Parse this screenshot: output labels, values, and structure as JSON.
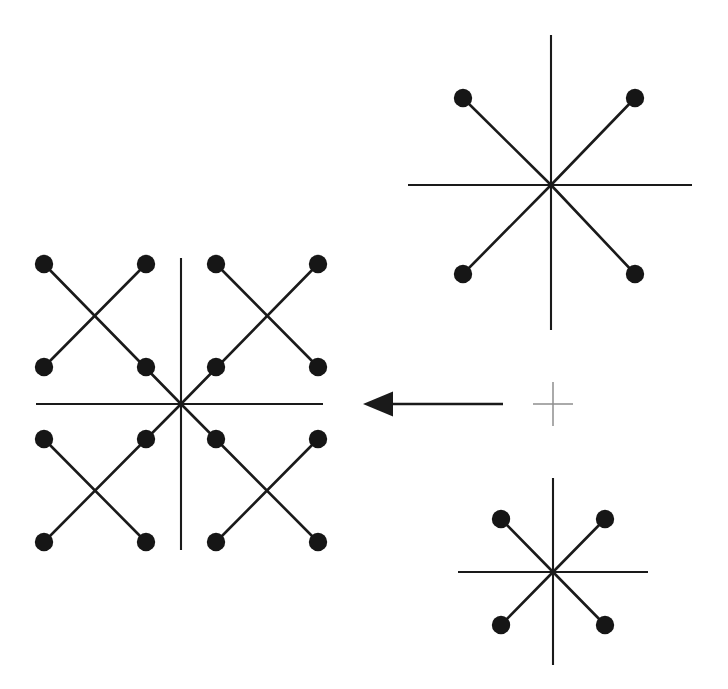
{
  "figure": {
    "background_color": "#ffffff",
    "ink_color": "#1a1a1a",
    "dot_color": "#161616",
    "marker_color": "#8e8e8e",
    "canvas": {
      "width": 728,
      "height": 689
    }
  },
  "stars": [
    {
      "id": "result-star",
      "name": "composite-star-left",
      "role": "result",
      "center": {
        "x": 181,
        "y": 404
      },
      "axis_horizontal": {
        "x1": 36,
        "x2": 323
      },
      "axis_vertical": {
        "y1": 258,
        "y2": 550
      },
      "dot_radius": 9.2,
      "dot_count": 16,
      "quadrant_count": 4,
      "dots": [
        {
          "x": 44,
          "y": 264,
          "ring": "outer",
          "quadrant": "upper-left"
        },
        {
          "x": 146,
          "y": 264,
          "ring": "outer",
          "quadrant": "upper-left"
        },
        {
          "x": 44,
          "y": 367,
          "ring": "outer",
          "quadrant": "upper-left"
        },
        {
          "x": 146,
          "y": 367,
          "ring": "inner",
          "quadrant": "upper-left"
        },
        {
          "x": 216,
          "y": 264,
          "ring": "outer",
          "quadrant": "upper-right"
        },
        {
          "x": 318,
          "y": 264,
          "ring": "outer",
          "quadrant": "upper-right"
        },
        {
          "x": 216,
          "y": 367,
          "ring": "inner",
          "quadrant": "upper-right"
        },
        {
          "x": 318,
          "y": 367,
          "ring": "outer",
          "quadrant": "upper-right"
        },
        {
          "x": 44,
          "y": 439,
          "ring": "outer",
          "quadrant": "lower-left"
        },
        {
          "x": 146,
          "y": 439,
          "ring": "inner",
          "quadrant": "lower-left"
        },
        {
          "x": 44,
          "y": 542,
          "ring": "outer",
          "quadrant": "lower-left"
        },
        {
          "x": 146,
          "y": 542,
          "ring": "outer",
          "quadrant": "lower-left"
        },
        {
          "x": 216,
          "y": 439,
          "ring": "inner",
          "quadrant": "lower-right"
        },
        {
          "x": 318,
          "y": 439,
          "ring": "outer",
          "quadrant": "lower-right"
        },
        {
          "x": 216,
          "y": 542,
          "ring": "outer",
          "quadrant": "lower-right"
        },
        {
          "x": 318,
          "y": 542,
          "ring": "outer",
          "quadrant": "lower-right"
        }
      ],
      "segments": [
        {
          "x1": 181,
          "y1": 404,
          "x2": 44,
          "y2": 264,
          "kind": "radial"
        },
        {
          "x1": 146,
          "y1": 264,
          "x2": 44,
          "y2": 367,
          "kind": "cross"
        },
        {
          "x1": 181,
          "y1": 404,
          "x2": 318,
          "y2": 264,
          "kind": "radial"
        },
        {
          "x1": 216,
          "y1": 264,
          "x2": 318,
          "y2": 367,
          "kind": "cross"
        },
        {
          "x1": 181,
          "y1": 404,
          "x2": 44,
          "y2": 542,
          "kind": "radial"
        },
        {
          "x1": 44,
          "y1": 439,
          "x2": 146,
          "y2": 542,
          "kind": "cross"
        },
        {
          "x1": 181,
          "y1": 404,
          "x2": 318,
          "y2": 542,
          "kind": "radial"
        },
        {
          "x1": 318,
          "y1": 439,
          "x2": 216,
          "y2": 542,
          "kind": "cross"
        }
      ]
    },
    {
      "id": "source-star-top",
      "name": "source-star-top-right",
      "role": "source",
      "center": {
        "x": 551,
        "y": 185
      },
      "axis_horizontal": {
        "x1": 408,
        "x2": 692
      },
      "axis_vertical": {
        "y1": 35,
        "y2": 330
      },
      "dot_radius": 9.2,
      "dot_count": 4,
      "dots": [
        {
          "x": 463,
          "y": 98,
          "quadrant": "upper-left"
        },
        {
          "x": 635,
          "y": 98,
          "quadrant": "upper-right"
        },
        {
          "x": 463,
          "y": 274,
          "quadrant": "lower-left"
        },
        {
          "x": 635,
          "y": 274,
          "quadrant": "lower-right"
        }
      ],
      "segments": [
        {
          "x1": 551,
          "y1": 185,
          "x2": 463,
          "y2": 98,
          "kind": "radial"
        },
        {
          "x1": 551,
          "y1": 185,
          "x2": 635,
          "y2": 98,
          "kind": "radial"
        },
        {
          "x1": 551,
          "y1": 185,
          "x2": 463,
          "y2": 274,
          "kind": "radial"
        },
        {
          "x1": 551,
          "y1": 185,
          "x2": 635,
          "y2": 274,
          "kind": "radial"
        }
      ]
    },
    {
      "id": "source-star-bottom",
      "name": "source-star-bottom-right",
      "role": "source",
      "center": {
        "x": 553,
        "y": 572
      },
      "axis_horizontal": {
        "x1": 458,
        "x2": 648
      },
      "axis_vertical": {
        "y1": 478,
        "y2": 665
      },
      "dot_radius": 9.2,
      "dot_count": 4,
      "dots": [
        {
          "x": 501,
          "y": 519,
          "quadrant": "upper-left"
        },
        {
          "x": 605,
          "y": 519,
          "quadrant": "upper-right"
        },
        {
          "x": 501,
          "y": 625,
          "quadrant": "lower-left"
        },
        {
          "x": 605,
          "y": 625,
          "quadrant": "lower-right"
        }
      ],
      "segments": [
        {
          "x1": 553,
          "y1": 572,
          "x2": 501,
          "y2": 519,
          "kind": "radial"
        },
        {
          "x1": 553,
          "y1": 572,
          "x2": 605,
          "y2": 519,
          "kind": "radial"
        },
        {
          "x1": 553,
          "y1": 572,
          "x2": 501,
          "y2": 625,
          "kind": "radial"
        },
        {
          "x1": 553,
          "y1": 572,
          "x2": 605,
          "y2": 625,
          "kind": "radial"
        }
      ]
    }
  ],
  "arrow": {
    "name": "transformation-arrow",
    "direction": "left",
    "tip": {
      "x": 363,
      "y": 404
    },
    "head_base_x": 393,
    "head_half_height": 12.5,
    "shaft": {
      "x1": 393,
      "x2": 503,
      "y": 404
    }
  },
  "marker": {
    "name": "center-cross-marker",
    "center": {
      "x": 553,
      "y": 404
    },
    "arm_horizontal": 20,
    "arm_vertical": 22
  }
}
